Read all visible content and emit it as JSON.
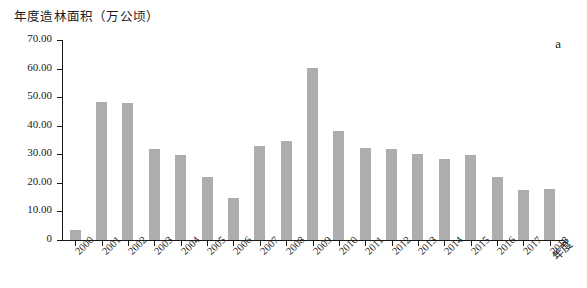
{
  "chart_data": {
    "type": "bar",
    "title": "年度造林面积（万公顷）",
    "panel_label": "a",
    "xlabel": "年度",
    "ylabel": "年度造林面积（万公顷）",
    "categories": [
      "2000",
      "2001",
      "2002",
      "2003",
      "2004",
      "2005",
      "2006",
      "2007",
      "2008",
      "2009",
      "2010",
      "2011",
      "2012",
      "2013",
      "2014",
      "2015",
      "2016",
      "2017",
      "2018"
    ],
    "values": [
      3.5,
      48.2,
      48.0,
      32.0,
      29.8,
      22.2,
      14.8,
      32.8,
      34.8,
      60.2,
      38.0,
      32.2,
      32.0,
      30.0,
      28.2,
      29.8,
      22.0,
      17.5,
      18.0
    ],
    "ylim": [
      0,
      70
    ],
    "yticks": [
      0,
      10,
      20,
      30,
      40,
      50,
      60,
      70
    ],
    "ytick_labels": [
      "0",
      "10.00",
      "20.00",
      "30.00",
      "40.00",
      "50.00",
      "60.00",
      "70.00"
    ],
    "grid": false,
    "legend": null,
    "bar_color": "#adadad",
    "axis_color": "#1a1a1a",
    "background": "#ffffff"
  }
}
